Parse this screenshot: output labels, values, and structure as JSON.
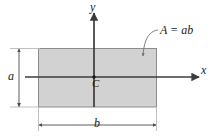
{
  "figure": {
    "kind": "centroid-diagram",
    "shape": "rectangle",
    "labels": {
      "axis_y": "y",
      "axis_x": "x",
      "centroid": "C",
      "height_dim": "a",
      "width_dim": "b",
      "area_formula": "A = ab"
    },
    "colors": {
      "shape_fill": "#d2d2d2",
      "shape_stroke": "#8c8c8c",
      "axis": "#3c3c3c",
      "dimension_line": "#4a4a4a",
      "extension_line": "#b0b0b0",
      "leader_line": "#6e6e6e",
      "background": "#ffffff",
      "text": "#1a1a1a"
    },
    "geometry": {
      "rect_left": 38,
      "rect_top": 48,
      "rect_right": 157,
      "rect_bottom": 107,
      "origin_x": 94,
      "origin_y": 77,
      "width_dim_line_y": 125,
      "height_dim_line_x": 19
    }
  }
}
